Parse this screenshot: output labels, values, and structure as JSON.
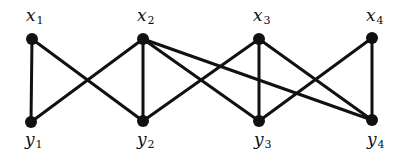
{
  "graph": {
    "type": "bipartite",
    "stroke_color": "#111111",
    "nodes": [
      {
        "id": "x1",
        "base": "x",
        "sub": "1",
        "x": 32,
        "y": 39,
        "lx": 26,
        "ly": 7
      },
      {
        "id": "x2",
        "base": "x",
        "sub": "2",
        "x": 143,
        "y": 39,
        "lx": 137,
        "ly": 7
      },
      {
        "id": "x3",
        "base": "x",
        "sub": "3",
        "x": 259,
        "y": 39,
        "lx": 253,
        "ly": 7
      },
      {
        "id": "x4",
        "base": "x",
        "sub": "4",
        "x": 372,
        "y": 38,
        "lx": 366,
        "ly": 7
      },
      {
        "id": "y1",
        "base": "y",
        "sub": "1",
        "x": 31,
        "y": 122,
        "lx": 25,
        "ly": 131
      },
      {
        "id": "y2",
        "base": "y",
        "sub": "2",
        "x": 143,
        "y": 121,
        "lx": 137,
        "ly": 131
      },
      {
        "id": "y3",
        "base": "y",
        "sub": "3",
        "x": 259,
        "y": 121,
        "lx": 254,
        "ly": 131
      },
      {
        "id": "y4",
        "base": "y",
        "sub": "4",
        "x": 372,
        "y": 120,
        "lx": 367,
        "ly": 131
      }
    ],
    "edges": [
      [
        "x1",
        "y1"
      ],
      [
        "x1",
        "y2"
      ],
      [
        "x2",
        "y1"
      ],
      [
        "x2",
        "y2"
      ],
      [
        "x2",
        "y3"
      ],
      [
        "x2",
        "y4"
      ],
      [
        "x3",
        "y2"
      ],
      [
        "x3",
        "y3"
      ],
      [
        "x3",
        "y4"
      ],
      [
        "x4",
        "y3"
      ],
      [
        "x4",
        "y4"
      ]
    ]
  }
}
